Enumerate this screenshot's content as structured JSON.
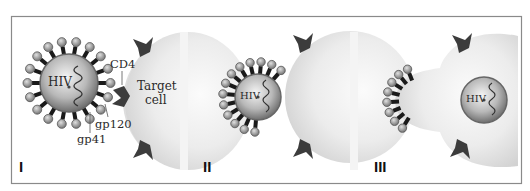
{
  "figure": {
    "panels": [
      {
        "id": "I",
        "label": "I",
        "virus_label": "HIV",
        "cell_label_line1": "Target",
        "cell_label_line2": "cell",
        "annotations": {
          "receptor": "CD4",
          "spike_head": "gp120",
          "spike_stalk": "gp41"
        }
      },
      {
        "id": "II",
        "label": "II",
        "virus_label": "HIV"
      },
      {
        "id": "III",
        "label": "III",
        "virus_label": "HIV"
      }
    ]
  },
  "colors": {
    "frame": "#8a8a8a",
    "cell_fill": "#e6e6e6",
    "virus_shell": "#7a7a7a",
    "spike_stalk": "#1a1a1a",
    "spike_head": "#9a9a9a",
    "receptor": "#3c3c3c"
  }
}
